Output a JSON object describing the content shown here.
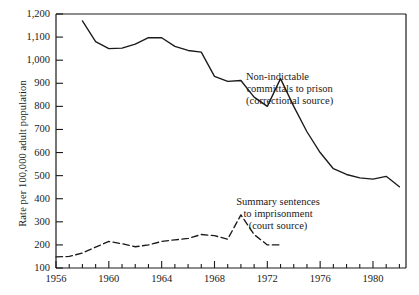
{
  "chart_data": {
    "type": "line",
    "title": "",
    "xlabel": "",
    "ylabel": "Rate per 100,000 adult population",
    "xlim": [
      1956,
      1982.5
    ],
    "ylim": [
      100,
      1200
    ],
    "grid": false,
    "legend_position": "inline-annotations",
    "x_tick_labels": [
      "1956",
      "1960",
      "1964",
      "1968",
      "1972",
      "1976",
      "1980"
    ],
    "x_tick_values": [
      1956,
      1960,
      1964,
      1968,
      1972,
      1976,
      1980
    ],
    "x_minor_tick_step": 1,
    "y_tick_labels": [
      "100",
      "200",
      "300",
      "400",
      "500",
      "600",
      "700",
      "800",
      "900",
      "1,000",
      "1,100",
      "1,200"
    ],
    "y_tick_values": [
      100,
      200,
      300,
      400,
      500,
      600,
      700,
      800,
      900,
      1000,
      1100,
      1200
    ],
    "series": [
      {
        "name": "Non-indictable committals to prison (correctional source)",
        "style": "solid",
        "color": "#1a1a1a",
        "x": [
          1958,
          1959,
          1960,
          1961,
          1962,
          1963,
          1964,
          1965,
          1966,
          1967,
          1968,
          1969,
          1970,
          1971,
          1972,
          1973,
          1974,
          1975,
          1976,
          1977,
          1978,
          1979,
          1980,
          1981,
          1982
        ],
        "values": [
          1170,
          1080,
          1050,
          1052,
          1070,
          1098,
          1097,
          1060,
          1042,
          1035,
          930,
          908,
          912,
          840,
          800,
          920,
          800,
          690,
          600,
          530,
          505,
          490,
          485,
          497,
          452
        ]
      },
      {
        "name": "Summary sentences to imprisonment (court source)",
        "style": "dashed",
        "color": "#1a1a1a",
        "x": [
          1956,
          1957,
          1958,
          1959,
          1960,
          1961,
          1962,
          1963,
          1964,
          1965,
          1966,
          1967,
          1968,
          1969,
          1970,
          1971,
          1972,
          1973
        ],
        "values": [
          148,
          150,
          165,
          190,
          215,
          205,
          192,
          200,
          215,
          222,
          228,
          245,
          240,
          225,
          330,
          245,
          200,
          200
        ]
      }
    ],
    "annotations": [
      {
        "id": "annotation-non-indictable",
        "lines": [
          "Non-indictable",
          "committals to prison",
          "(correctional source)"
        ]
      },
      {
        "id": "annotation-summary-sentences",
        "lines": [
          "Summary sentences",
          "to imprisonment",
          "(court source)"
        ]
      }
    ]
  }
}
